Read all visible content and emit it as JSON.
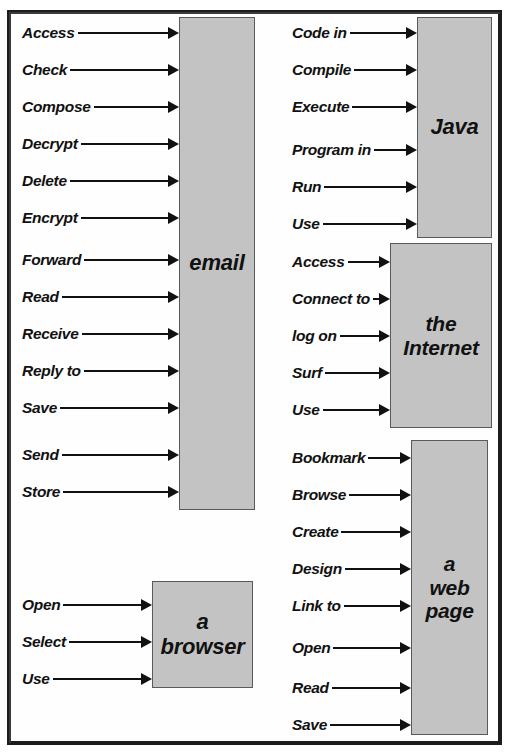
{
  "page": {
    "box_fill_color": "#c3c3c3",
    "box_border_color": "#5a5a5a",
    "ink_color": "#111111",
    "frame_color": "#1c1c1c"
  },
  "groups": [
    {
      "id": "email",
      "concept": "email",
      "collocates": [
        "Access",
        "Check",
        "Compose",
        "Decrypt",
        "Delete",
        "Encrypt",
        "Forward",
        "Read",
        "Receive",
        "Reply to",
        "Save",
        "Send",
        "Store"
      ]
    },
    {
      "id": "browser",
      "concept": "a\nbrowser",
      "collocates": [
        "Open",
        "Select",
        "Use"
      ]
    },
    {
      "id": "java",
      "concept": "Java",
      "collocates": [
        "Code in",
        "Compile",
        "Execute",
        "Program in",
        "Run",
        "Use"
      ]
    },
    {
      "id": "internet",
      "concept": "the\nInternet",
      "collocates": [
        "Access",
        "Connect to",
        "log on",
        "Surf",
        "Use"
      ]
    },
    {
      "id": "webpage",
      "concept": "a\nweb\npage",
      "collocates": [
        "Bookmark",
        "Browse",
        "Create",
        "Design",
        "Link to",
        "Open",
        "Read",
        "Save"
      ]
    }
  ]
}
